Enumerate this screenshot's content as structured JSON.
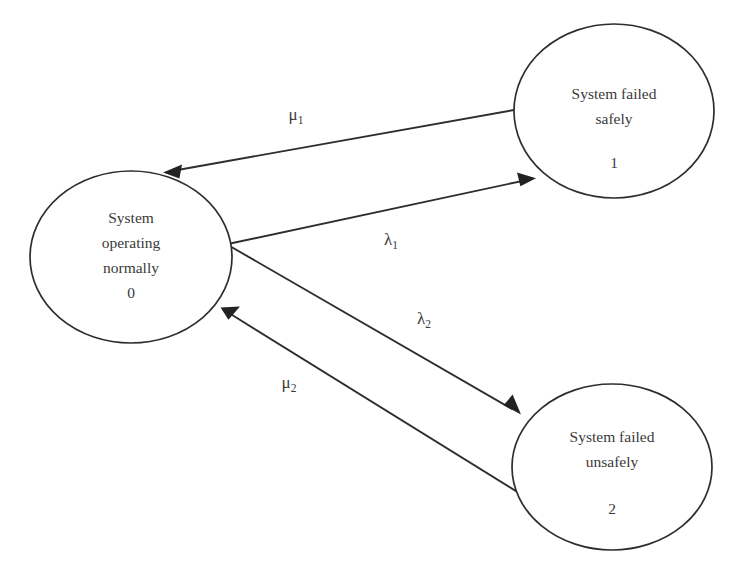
{
  "diagram": {
    "type": "state-transition-markov",
    "background_color": "#ffffff",
    "stroke_color": "#2e2e2e",
    "text_color": "#3a3a3a",
    "nodes": [
      {
        "id": "state-0",
        "lines": [
          "System",
          "operating",
          "normally"
        ],
        "index": "0",
        "cx": 131,
        "cy": 257,
        "rx": 101,
        "ry": 86
      },
      {
        "id": "state-1",
        "lines": [
          "System failed",
          "safely"
        ],
        "index": "1",
        "cx": 614,
        "cy": 111,
        "rx": 100,
        "ry": 87
      },
      {
        "id": "state-2",
        "lines": [
          "System failed",
          "unsafely"
        ],
        "index": "2",
        "cx": 612,
        "cy": 467,
        "rx": 100,
        "ry": 83
      }
    ],
    "edges": [
      {
        "id": "edge-mu1",
        "symbol": "μ",
        "subscript": "1",
        "from": "state-1",
        "to": "state-0",
        "label_x": 296,
        "label_y": 116
      },
      {
        "id": "edge-lambda1",
        "symbol": "λ",
        "subscript": "1",
        "from": "state-0",
        "to": "state-1",
        "label_x": 391,
        "label_y": 241
      },
      {
        "id": "edge-lambda2",
        "symbol": "λ",
        "subscript": "2",
        "from": "state-0",
        "to": "state-2",
        "label_x": 424,
        "label_y": 320
      },
      {
        "id": "edge-mu2",
        "symbol": "μ",
        "subscript": "2",
        "from": "state-2",
        "to": "state-0",
        "label_x": 289,
        "label_y": 384
      }
    ],
    "bleed_lines": [
      "                ",
      "             ",
      "               ",
      "               "
    ]
  }
}
